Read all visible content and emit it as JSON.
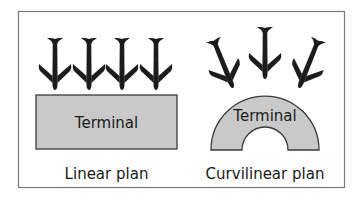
{
  "diagram": {
    "type": "airport-terminal-plans",
    "colors": {
      "frame": "#7a7a7a",
      "terminal_fill": "#c9c9c9",
      "terminal_stroke": "#3a3a3a",
      "aircraft": "#1c1c1c",
      "text": "#1a1a1a",
      "background": "#ffffff"
    },
    "panels": [
      {
        "id": "linear",
        "terminal_label": "Terminal",
        "caption": "Linear plan",
        "aircraft_count": 4
      },
      {
        "id": "curvilinear",
        "terminal_label": "Terminal",
        "caption": "Curvilinear plan",
        "aircraft_count": 3
      }
    ]
  }
}
